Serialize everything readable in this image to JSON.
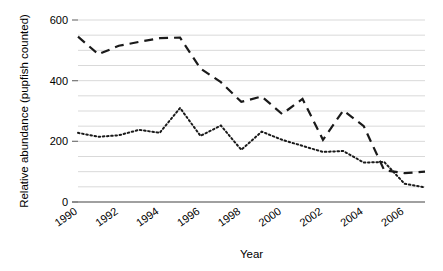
{
  "chart_data": {
    "type": "line",
    "title": "",
    "xlabel": "Year",
    "ylabel": "Relative abundance (pupfish counted)",
    "xlim": [
      1990,
      2007
    ],
    "ylim": [
      0,
      600
    ],
    "ytick_values": [
      0,
      200,
      400,
      600
    ],
    "ytick_labels": [
      "0",
      "200",
      "400",
      "600"
    ],
    "xtick_values": [
      1990,
      1992,
      1994,
      1996,
      1998,
      2000,
      2002,
      2004,
      2006
    ],
    "xtick_labels": [
      "1990",
      "1992",
      "1994",
      "1996",
      "1998",
      "2000",
      "2002",
      "2004",
      "2006"
    ],
    "grid": "horizontal-minor-50",
    "gridline_values": [
      50,
      100,
      150,
      200,
      250,
      300,
      350,
      400,
      450,
      500,
      550,
      600
    ],
    "gridline_color": "#d9d9d9",
    "axis_color": "#808080",
    "legend": "none",
    "x": [
      1990,
      1991,
      1992,
      1993,
      1994,
      1995,
      1996,
      1997,
      1998,
      1999,
      2000,
      2001,
      2002,
      2003,
      2004,
      2005,
      2006,
      2007
    ],
    "series": [
      {
        "name": "dashed-series",
        "style": "dashed",
        "color": "#1a1a1a",
        "values": [
          545,
          487,
          515,
          528,
          540,
          542,
          440,
          395,
          330,
          348,
          290,
          340,
          205,
          302,
          250,
          105,
          95,
          100
        ]
      },
      {
        "name": "dotted-series",
        "style": "dotted",
        "color": "#1a1a1a",
        "values": [
          228,
          215,
          220,
          238,
          228,
          310,
          218,
          252,
          172,
          232,
          205,
          185,
          165,
          168,
          130,
          132,
          60,
          48
        ]
      }
    ]
  },
  "axes": {
    "y_title": "Relative abundance (pupfish counted)",
    "x_title": "Year"
  }
}
